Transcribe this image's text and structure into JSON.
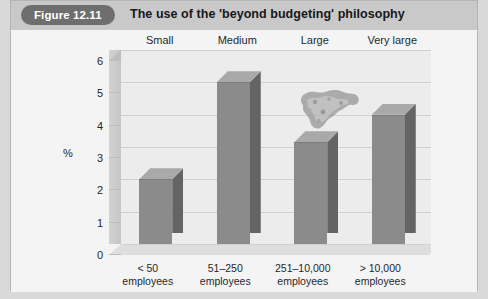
{
  "figure": {
    "badge": "Figure 12.11",
    "title": "The use of the 'beyond budgeting' philosophy"
  },
  "chart_data": {
    "type": "bar",
    "title": "The use of the 'beyond budgeting' philosophy",
    "xlabel": "",
    "ylabel": "%",
    "ylim": [
      0,
      6
    ],
    "yticks": [
      "0",
      "1",
      "2",
      "3",
      "4",
      "5",
      "6"
    ],
    "grid": true,
    "legend": "none",
    "style": "3d-column",
    "categories": [
      "< 50 employees",
      "51–250 employees",
      "251–10,000 employees",
      "> 10,000 employees"
    ],
    "category_top_labels": [
      "Small",
      "Medium",
      "Large",
      "Very large"
    ],
    "values": [
      2.0,
      5.0,
      3.15,
      4.0
    ],
    "colors": {
      "bar_front": "#8b8b8b",
      "bar_side": "#646464",
      "bar_top": "#a9a9a9",
      "plot_background": "#ececec",
      "header_band": "#c9c9c9",
      "badge": "#6e6e6e"
    },
    "annotations": [
      {
        "name": "scan-smudge",
        "note": "scanning artifact above the 'Large' column"
      }
    ]
  }
}
